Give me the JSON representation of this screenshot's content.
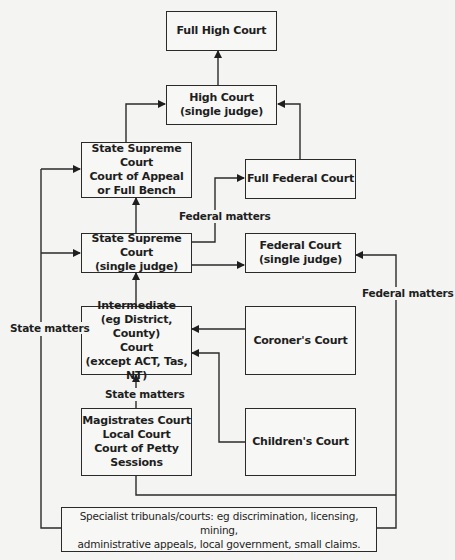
{
  "diagram": {
    "nodes": {
      "full_high_court": {
        "lines": [
          "Full High Court"
        ]
      },
      "high_court_single": {
        "lines": [
          "High Court",
          "(single judge)"
        ]
      },
      "state_supreme_appeal": {
        "lines": [
          "State Supreme Court",
          "Court of Appeal",
          "or Full Bench"
        ]
      },
      "full_federal_court": {
        "lines": [
          "Full Federal Court"
        ]
      },
      "state_supreme_single": {
        "lines": [
          "State Supreme Court",
          "(single judge)"
        ]
      },
      "federal_court_single": {
        "lines": [
          "Federal Court",
          "(single judge)"
        ]
      },
      "intermediate": {
        "lines": [
          "Intermediate",
          "(eg District, County)",
          "Court",
          "(except ACT, Tas, NT)"
        ]
      },
      "coroners_court": {
        "lines": [
          "Coroner's Court"
        ]
      },
      "magistrates": {
        "lines": [
          "Magistrates Court",
          "Local Court",
          "Court of Petty",
          "Sessions"
        ]
      },
      "childrens_court": {
        "lines": [
          "Children's Court"
        ]
      },
      "specialist": {
        "lines": [
          "Specialist tribunals/courts: eg discrimination, licensing, mining,",
          "administrative appeals, local government, small claims."
        ]
      }
    },
    "labels": {
      "federal_matters_mid": "Federal matters",
      "federal_matters_right": "Federal matters",
      "state_matters_left": "State matters",
      "state_matters_mid": "State matters"
    },
    "edges": [
      {
        "from": "high_court_single",
        "to": "full_high_court"
      },
      {
        "from": "state_supreme_appeal",
        "to": "high_court_single"
      },
      {
        "from": "full_federal_court",
        "to": "high_court_single"
      },
      {
        "from": "state_supreme_single",
        "to": "state_supreme_appeal"
      },
      {
        "from": "state_supreme_single",
        "to": "full_federal_court",
        "label": "Federal matters"
      },
      {
        "from": "state_supreme_single",
        "to": "federal_court_single"
      },
      {
        "from": "intermediate",
        "to": "state_supreme_single"
      },
      {
        "from": "coroners_court",
        "to": "intermediate"
      },
      {
        "from": "childrens_court",
        "to": "intermediate"
      },
      {
        "from": "magistrates",
        "to": "intermediate",
        "label": "State matters"
      },
      {
        "from": "specialist",
        "to": "state_supreme_appeal",
        "label": "State matters"
      },
      {
        "from": "specialist",
        "to": "state_supreme_single",
        "label": "State matters"
      },
      {
        "from": "specialist",
        "to": "federal_court_single",
        "label": "Federal matters"
      },
      {
        "from": "magistrates",
        "to": "federal_court_single",
        "label": "Federal matters"
      }
    ]
  }
}
